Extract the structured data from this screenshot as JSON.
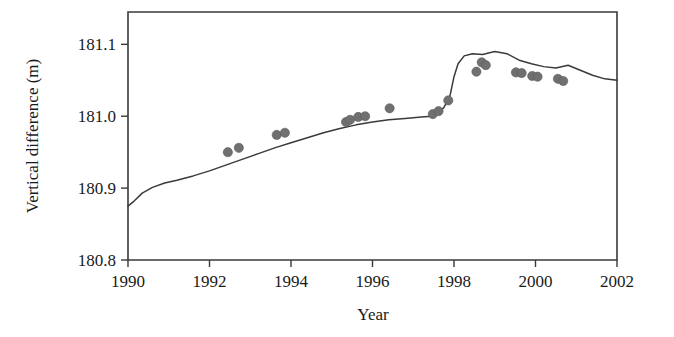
{
  "chart_data": {
    "type": "line",
    "title": "",
    "xlabel": "Year",
    "ylabel": "Vertical difference (m)",
    "xlim": [
      1990,
      2002
    ],
    "ylim": [
      180.8,
      181.145
    ],
    "xticks": [
      1990,
      1992,
      1994,
      1996,
      1998,
      2000,
      2002
    ],
    "xtick_labels": [
      "1990",
      "1992",
      "1994",
      "1996",
      "1998",
      "2000",
      "2002"
    ],
    "yticks": [
      180.8,
      180.9,
      181.0,
      181.1
    ],
    "ytick_labels": [
      "180.8",
      "180.9",
      "181.0",
      "181.1"
    ],
    "grid": false,
    "legend": "none",
    "series": [
      {
        "name": "modelled vertical difference",
        "type": "line",
        "color": "#3a3a3a",
        "x": [
          1990.0,
          1990.15,
          1990.35,
          1990.6,
          1990.9,
          1991.2,
          1991.6,
          1992.0,
          1992.4,
          1992.8,
          1993.2,
          1993.6,
          1994.0,
          1994.4,
          1994.8,
          1995.2,
          1995.6,
          1996.0,
          1996.4,
          1996.8,
          1997.2,
          1997.45,
          1997.6,
          1997.75,
          1997.9,
          1998.0,
          1998.1,
          1998.25,
          1998.45,
          1998.7,
          1999.0,
          1999.3,
          1999.6,
          1999.9,
          2000.2,
          2000.5,
          2000.8,
          2001.1,
          2001.4,
          2001.7,
          2002.0
        ],
        "y": [
          180.875,
          180.882,
          180.893,
          180.901,
          180.907,
          180.911,
          180.917,
          180.924,
          180.932,
          180.94,
          180.948,
          180.956,
          180.963,
          180.97,
          180.977,
          180.983,
          180.988,
          180.992,
          180.995,
          180.997,
          180.999,
          181.0,
          181.004,
          181.012,
          181.028,
          181.055,
          181.073,
          181.084,
          181.087,
          181.086,
          181.09,
          181.087,
          181.078,
          181.073,
          181.069,
          181.067,
          181.071,
          181.064,
          181.057,
          181.052,
          181.05
        ]
      },
      {
        "name": "observed vertical difference",
        "type": "scatter",
        "color": "#707070",
        "marker": "circle",
        "x": [
          1992.45,
          1992.72,
          1993.65,
          1993.85,
          1995.35,
          1995.45,
          1995.65,
          1995.82,
          1996.42,
          1997.48,
          1997.62,
          1997.86,
          1998.55,
          1998.68,
          1998.78,
          1999.52,
          1999.66,
          1999.92,
          2000.05,
          2000.55,
          2000.68
        ],
        "y": [
          180.95,
          180.956,
          180.974,
          180.977,
          180.992,
          180.995,
          180.999,
          181.0,
          181.011,
          181.003,
          181.007,
          181.022,
          181.062,
          181.075,
          181.071,
          181.061,
          181.06,
          181.056,
          181.055,
          181.052,
          181.049
        ]
      }
    ]
  }
}
